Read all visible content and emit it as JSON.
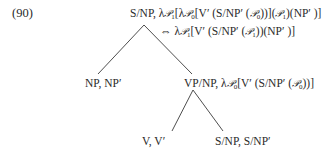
{
  "example_number": "(90)",
  "tree": {
    "root": {
      "category": "S/NP,",
      "formula_parts": [
        "λ",
        "𝒫",
        "1",
        "[λ",
        "𝒫",
        "0",
        "[V′ (S/NP′ (",
        "𝒫",
        "0",
        "))](",
        "𝒫",
        "1",
        ")(NP′ )]"
      ]
    },
    "equivalence": {
      "symbol": "⇔",
      "formula_parts": [
        "λ",
        "𝒫",
        "1",
        "[V′ (S/NP′ (",
        "𝒫",
        "1",
        "))(NP′ )]"
      ]
    },
    "left_child": {
      "label": "NP, NP′"
    },
    "right_child": {
      "category": "VP/NP,",
      "formula_parts": [
        "λ",
        "𝒫",
        "0",
        "[V′ (S/NP′ (",
        "𝒫",
        "0",
        "))]"
      ]
    },
    "vp_left_child": {
      "label": "V, V′"
    },
    "vp_right_child": {
      "label": "S/NP, S/NP′"
    }
  },
  "colors": {
    "text": "#2a2a2a",
    "lines": "#3a3a3a",
    "background": "#ffffff"
  }
}
